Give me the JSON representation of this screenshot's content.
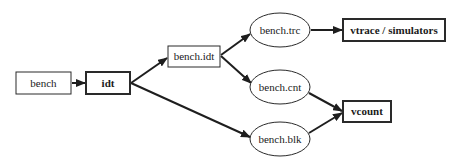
{
  "diagram": {
    "type": "flow-graph",
    "nodes": [
      {
        "id": "bench",
        "label": "bench",
        "shape": "box",
        "bold": false
      },
      {
        "id": "idt",
        "label": "idt",
        "shape": "box",
        "bold": true
      },
      {
        "id": "bench_idt",
        "label": "bench.idt",
        "shape": "box",
        "bold": false
      },
      {
        "id": "bench_trc",
        "label": "bench.trc",
        "shape": "ellipse",
        "bold": false
      },
      {
        "id": "bench_cnt",
        "label": "bench.cnt",
        "shape": "ellipse",
        "bold": false
      },
      {
        "id": "bench_blk",
        "label": "bench.blk",
        "shape": "ellipse",
        "bold": false
      },
      {
        "id": "vtrace",
        "label": "vtrace / simulators",
        "shape": "box",
        "bold": true
      },
      {
        "id": "vcount",
        "label": "vcount",
        "shape": "box",
        "bold": true
      }
    ],
    "edges": [
      {
        "from": "bench",
        "to": "idt"
      },
      {
        "from": "idt",
        "to": "bench_idt"
      },
      {
        "from": "idt",
        "to": "bench_blk"
      },
      {
        "from": "bench_idt",
        "to": "bench_trc"
      },
      {
        "from": "bench_idt",
        "to": "bench_cnt"
      },
      {
        "from": "bench_trc",
        "to": "vtrace"
      },
      {
        "from": "bench_cnt",
        "to": "vcount"
      },
      {
        "from": "bench_blk",
        "to": "vcount"
      }
    ]
  }
}
